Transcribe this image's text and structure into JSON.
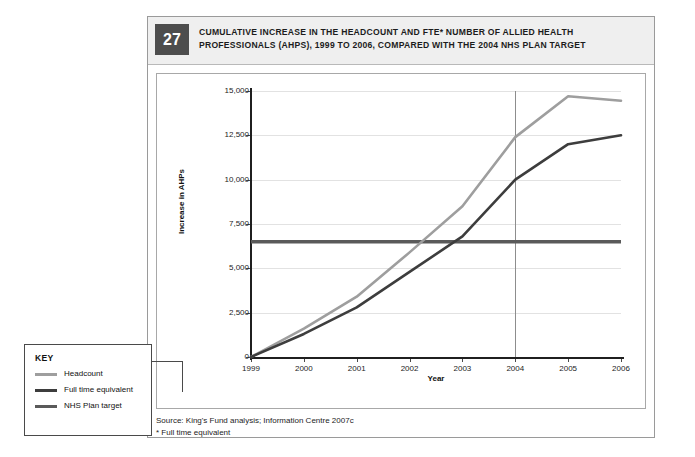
{
  "figure": {
    "number": "27",
    "title": "CUMULATIVE INCREASE IN THE HEADCOUNT AND FTE* NUMBER OF ALLIED HEALTH PROFESSIONALS (AHPS), 1999 TO 2006, COMPARED WITH THE 2004 NHS PLAN TARGET",
    "source": "Source: King's Fund analysis; Information Centre 2007c",
    "footnote": "* Full time equivalent"
  },
  "key": {
    "title": "KEY",
    "items": [
      {
        "label": "Headcount",
        "color": "#9e9e9e"
      },
      {
        "label": "Full time equivalent",
        "color": "#3d3d3d"
      },
      {
        "label": "NHS Plan target",
        "color": "#5a5a5a"
      }
    ]
  },
  "colors": {
    "headcount": "#9e9e9e",
    "fte": "#3d3d3d",
    "target": "#5a5a5a",
    "grid": "#e2e2e2",
    "axis": "#1f1f1f",
    "marker": "#8d8d8d",
    "header_bg": "#efefef",
    "badge_bg": "#4d4d4d"
  },
  "chart_data": {
    "type": "line",
    "xlabel": "Year",
    "ylabel": "Increase in AHPs",
    "x": [
      1999,
      2000,
      2001,
      2002,
      2003,
      2004,
      2005,
      2006
    ],
    "xtick_labels": [
      "1999",
      "2000",
      "2001",
      "2002",
      "2003",
      "2004",
      "2005",
      "2006"
    ],
    "ytick_labels": [
      "0",
      "2,500",
      "5,000",
      "7,500",
      "10,000",
      "12,500",
      "15,000"
    ],
    "ytick_values": [
      0,
      2500,
      5000,
      7500,
      10000,
      12500,
      15000
    ],
    "ylim": [
      0,
      15000
    ],
    "xlim": [
      1999,
      2006
    ],
    "grid": true,
    "legend_position": "outside-bottom-left",
    "annotations": [
      {
        "type": "vline",
        "x": 2004,
        "label": "2004 NHS Plan target year"
      }
    ],
    "series": [
      {
        "name": "Headcount",
        "color": "#9e9e9e",
        "values": [
          0,
          1600,
          3400,
          5900,
          8500,
          12400,
          14700,
          14450
        ]
      },
      {
        "name": "Full time equivalent",
        "color": "#3d3d3d",
        "values": [
          0,
          1300,
          2800,
          4800,
          6800,
          10000,
          12000,
          12500
        ]
      },
      {
        "name": "NHS Plan target",
        "color": "#5a5a5a",
        "type": "hline",
        "value": 6500,
        "values": [
          6500,
          6500,
          6500,
          6500,
          6500,
          6500,
          6500,
          6500
        ]
      }
    ]
  }
}
